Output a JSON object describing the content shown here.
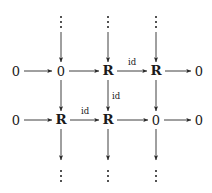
{
  "figure": {
    "type": "commutative-diagram",
    "background_color": "#ffffff",
    "stroke_color": "#2a2a2a",
    "text_color": "#1a1a1a"
  },
  "symbols": {
    "zero": "0",
    "ring": "R",
    "identity": "id"
  },
  "rows": [
    {
      "index": 0,
      "y": 71,
      "nodes": [
        {
          "label": "0",
          "kind": "zero",
          "x": 16
        },
        {
          "label": "0",
          "kind": "zero",
          "x": 61
        },
        {
          "label": "R",
          "kind": "ring",
          "x": 108
        },
        {
          "label": "R",
          "kind": "ring",
          "x": 156
        },
        {
          "label": "0",
          "kind": "zero",
          "x": 199
        }
      ],
      "edge_labels": [
        {
          "label": "id",
          "x": 132,
          "y": 62
        }
      ]
    },
    {
      "index": 1,
      "y": 120,
      "nodes": [
        {
          "label": "0",
          "kind": "zero",
          "x": 16
        },
        {
          "label": "R",
          "kind": "ring",
          "x": 61
        },
        {
          "label": "R",
          "kind": "ring",
          "x": 108
        },
        {
          "label": "0",
          "kind": "zero",
          "x": 156
        },
        {
          "label": "0",
          "kind": "zero",
          "x": 199
        }
      ],
      "edge_labels": [
        {
          "label": "id",
          "x": 85,
          "y": 111
        }
      ]
    }
  ],
  "vertical_edge_labels": [
    {
      "label": "id",
      "x": 116,
      "y": 96
    }
  ],
  "columns": [
    {
      "x": 61
    },
    {
      "x": 108
    },
    {
      "x": 156
    }
  ],
  "vdots": {
    "top_y": 22,
    "bottom_y": 176,
    "dot_count": 3
  }
}
